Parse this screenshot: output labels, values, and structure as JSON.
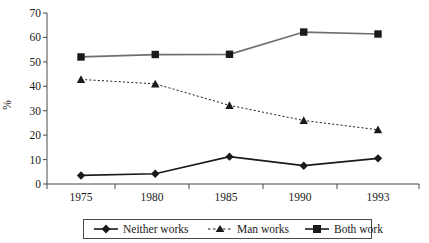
{
  "chart_data": {
    "type": "line",
    "title": "",
    "xlabel": "",
    "ylabel": "%",
    "categories": [
      "1975",
      "1980",
      "1985",
      "1990",
      "1993"
    ],
    "ylim": [
      0,
      70
    ],
    "yticks": [
      0,
      10,
      20,
      30,
      40,
      50,
      60,
      70
    ],
    "ytick_labels": [
      "0",
      "10",
      "20",
      "30",
      "40",
      "50",
      "60",
      "70"
    ],
    "grid": false,
    "legend_position": "bottom",
    "series": [
      {
        "name": "Neither works",
        "values": [
          3.5,
          4.2,
          11.2,
          7.5,
          10.5
        ],
        "marker": "diamond",
        "line_style": "solid",
        "color": "#1a1a1a"
      },
      {
        "name": "Man works",
        "values": [
          42.8,
          41.0,
          32.2,
          26.0,
          22.2
        ],
        "marker": "triangle",
        "line_style": "dotted",
        "color": "#1a1a1a"
      },
      {
        "name": "Both work",
        "values": [
          52.0,
          53.0,
          53.1,
          62.2,
          61.4
        ],
        "marker": "square",
        "line_style": "solid",
        "color": "#6e6e6e"
      }
    ]
  },
  "axis": {
    "y_title": "%",
    "y_tick_0": "0",
    "y_tick_1": "10",
    "y_tick_2": "20",
    "y_tick_3": "30",
    "y_tick_4": "40",
    "y_tick_5": "50",
    "y_tick_6": "60",
    "y_tick_7": "70",
    "x_tick_0": "1975",
    "x_tick_1": "1980",
    "x_tick_2": "1985",
    "x_tick_3": "1990",
    "x_tick_4": "1993"
  },
  "legend": {
    "entries": [
      {
        "label": "Neither works",
        "marker": "diamond-marker-icon"
      },
      {
        "label": "Man works",
        "marker": "triangle-marker-icon"
      },
      {
        "label": "Both work",
        "marker": "square-marker-icon"
      }
    ]
  },
  "colors": {
    "series_dark": "#1a1a1a",
    "series_gray": "#6e6e6e",
    "axis": "#4a4a4a",
    "background": "#ffffff"
  }
}
